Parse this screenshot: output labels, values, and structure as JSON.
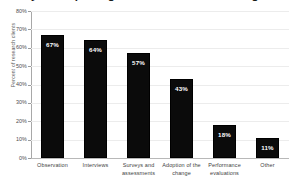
{
  "chart_data": {
    "type": "bar",
    "title": "Ways of capturing the data when measuring the change",
    "xlabel": "",
    "ylabel": "Percent of research clients",
    "categories": [
      "Observation",
      "Interviews",
      "Surveys and assessments",
      "Adoption of the change",
      "Performance evaluations",
      "Other"
    ],
    "values": [
      67,
      64,
      57,
      43,
      18,
      11
    ],
    "value_labels": [
      "67%",
      "64%",
      "57%",
      "43%",
      "18%",
      "11%"
    ],
    "ylim": [
      0,
      80
    ],
    "ytick_labels": [
      "80%",
      "70%",
      "60%",
      "50%",
      "40%",
      "30%",
      "20%",
      "10%",
      "0%"
    ],
    "ytick_values": [
      80,
      70,
      60,
      50,
      40,
      30,
      20,
      10,
      0
    ],
    "grid": true,
    "legend": false,
    "bar_color": "#0b0b0b",
    "value_label_color": "#ffffff",
    "grid_color": "#ececec",
    "axis_color": "#a8a8a8",
    "background": "#ffffff"
  }
}
